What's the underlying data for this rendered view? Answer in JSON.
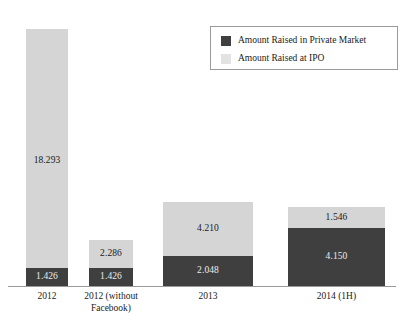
{
  "chart_data": {
    "type": "bar",
    "subtype": "stacked-bar",
    "title": "",
    "subtitle": "",
    "xlabel": "",
    "ylabel": "",
    "grid": false,
    "axis_visible": {
      "x": true,
      "y": false
    },
    "ylim": [
      0,
      19.719
    ],
    "categories": [
      "2012",
      "2012 (without\nFacebook)",
      "2013",
      "2014 (1H)"
    ],
    "series": [
      {
        "name": "Amount Raised in Private Market",
        "color": "#3f3f3f",
        "values": [
          1.426,
          1.426,
          2.048,
          4.15
        ],
        "labels": [
          "1.426",
          "1.426",
          "2.048",
          "4.150"
        ]
      },
      {
        "name": "Amount Raised at IPO",
        "color": "#d5d5d5",
        "values": [
          18.293,
          2.286,
          4.21,
          1.546
        ],
        "labels": [
          "18.293",
          "2.286",
          "4.210",
          "1.546"
        ]
      }
    ],
    "totals": [
      19.719,
      3.712,
      6.258,
      5.696
    ],
    "legend": {
      "position": "top-right",
      "entries": [
        {
          "label": "Amount Raised in Private Market",
          "color": "#3f3f3f",
          "swatch": "private-market-swatch"
        },
        {
          "label": "Amount Raised at IPO",
          "color": "#e2e2e2",
          "swatch": "ipo-swatch"
        }
      ]
    }
  },
  "bars": [
    {
      "category": "2012",
      "left": 26,
      "width": 42,
      "private": {
        "label": "1.426",
        "height": 18
      },
      "ipo": {
        "label": "18.293",
        "height": 239,
        "label_anchored": true
      }
    },
    {
      "category": "2012 (without\nFacebook)",
      "left": 89,
      "width": 44,
      "private": {
        "label": "1.426",
        "height": 18
      },
      "ipo": {
        "label": "2.286",
        "height": 28,
        "label_anchored": false
      }
    },
    {
      "category": "2013",
      "left": 163,
      "width": 90,
      "private": {
        "label": "2.048",
        "height": 30
      },
      "ipo": {
        "label": "4.210",
        "height": 54,
        "label_anchored": false
      }
    },
    {
      "category": "2014 (1H)",
      "left": 288,
      "width": 97,
      "private": {
        "label": "4.150",
        "height": 58
      },
      "ipo": {
        "label": "1.546",
        "height": 21,
        "label_anchored": false
      }
    }
  ]
}
